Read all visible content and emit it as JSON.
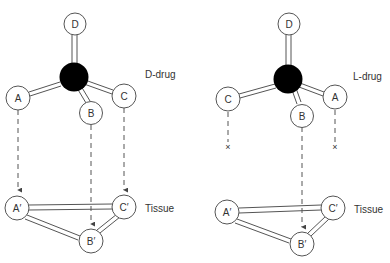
{
  "diagrams": [
    {
      "id": "d-drug",
      "label": "D-drug",
      "tissue_label": "Tissue",
      "atoms": {
        "D": "D",
        "A": "A",
        "B": "B",
        "C": "C"
      },
      "tissue_sites": {
        "A": "A′",
        "B": "B′",
        "C": "C′"
      },
      "bindings": [
        {
          "from": "A",
          "to": "A′",
          "binds": true
        },
        {
          "from": "B",
          "to": "B′",
          "binds": true
        },
        {
          "from": "C",
          "to": "C′",
          "binds": true
        }
      ]
    },
    {
      "id": "l-drug",
      "label": "L-drug",
      "tissue_label": "Tissue",
      "atoms": {
        "D": "D",
        "A": "A",
        "B": "B",
        "C": "C"
      },
      "tissue_sites": {
        "A": "A′",
        "B": "B′",
        "C": "C′"
      },
      "bindings": [
        {
          "from": "C",
          "to": null,
          "binds": false,
          "end_mark": "×"
        },
        {
          "from": "B",
          "to": "B′",
          "binds": true
        },
        {
          "from": "A",
          "to": null,
          "binds": false,
          "end_mark": "×"
        }
      ]
    }
  ],
  "colors": {
    "central_atom": "#000000",
    "outline": "#444444",
    "background": "#ffffff"
  }
}
